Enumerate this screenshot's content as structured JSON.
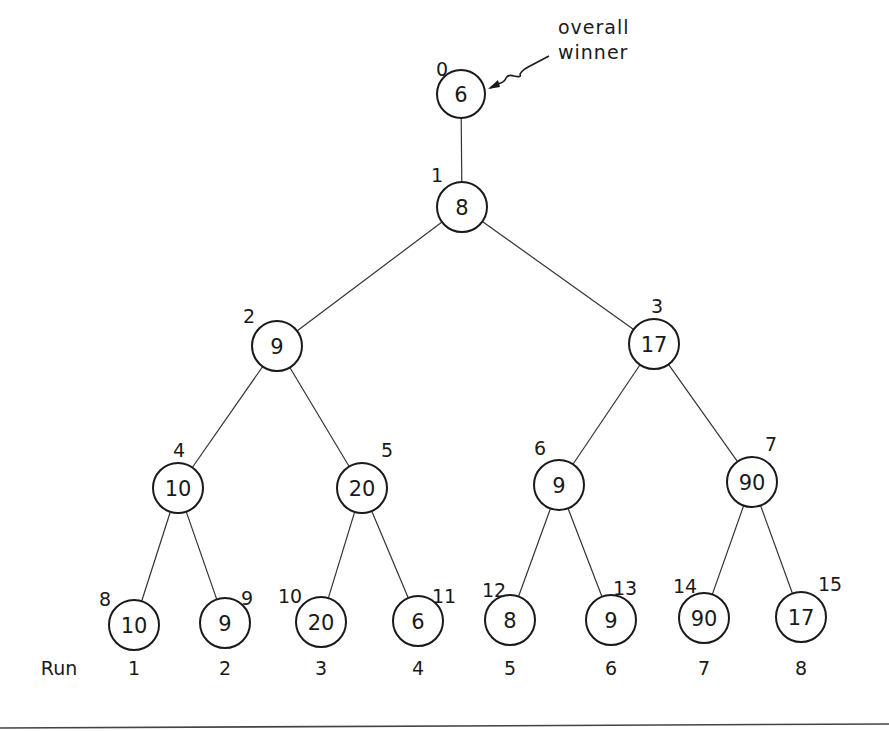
{
  "annotation": {
    "line1": "overall",
    "line2": "winner"
  },
  "run_label": "Run",
  "nodes": [
    {
      "index": "0",
      "value": "6",
      "cx": 461,
      "cy": 94,
      "r": 24,
      "lx": 442,
      "ly": 69
    },
    {
      "index": "1",
      "value": "8",
      "cx": 462,
      "cy": 207,
      "r": 25,
      "lx": 437,
      "ly": 175
    },
    {
      "index": "2",
      "value": "9",
      "cx": 277,
      "cy": 346,
      "r": 25,
      "lx": 249,
      "ly": 316
    },
    {
      "index": "3",
      "value": "17",
      "cx": 654,
      "cy": 344,
      "r": 25,
      "lx": 657,
      "ly": 306
    },
    {
      "index": "4",
      "value": "10",
      "cx": 178,
      "cy": 488,
      "r": 25,
      "lx": 179,
      "ly": 450
    },
    {
      "index": "5",
      "value": "20",
      "cx": 362,
      "cy": 488,
      "r": 25,
      "lx": 387,
      "ly": 450
    },
    {
      "index": "6",
      "value": "9",
      "cx": 559,
      "cy": 485,
      "r": 25,
      "lx": 540,
      "ly": 448
    },
    {
      "index": "7",
      "value": "90",
      "cx": 752,
      "cy": 482,
      "r": 25,
      "lx": 771,
      "ly": 444
    },
    {
      "index": "8",
      "value": "10",
      "cx": 134,
      "cy": 625,
      "r": 25,
      "lx": 105,
      "ly": 599
    },
    {
      "index": "9",
      "value": "9",
      "cx": 225,
      "cy": 623,
      "r": 25,
      "lx": 247,
      "ly": 598
    },
    {
      "index": "10",
      "value": "20",
      "cx": 321,
      "cy": 622,
      "r": 25,
      "lx": 290,
      "ly": 596
    },
    {
      "index": "11",
      "value": "6",
      "cx": 418,
      "cy": 621,
      "r": 25,
      "lx": 444,
      "ly": 596
    },
    {
      "index": "12",
      "value": "8",
      "cx": 510,
      "cy": 620,
      "r": 25,
      "lx": 494,
      "ly": 590
    },
    {
      "index": "13",
      "value": "9",
      "cx": 611,
      "cy": 620,
      "r": 25,
      "lx": 625,
      "ly": 588
    },
    {
      "index": "14",
      "value": "90",
      "cx": 704,
      "cy": 618,
      "r": 25,
      "lx": 685,
      "ly": 586
    },
    {
      "index": "15",
      "value": "17",
      "cx": 801,
      "cy": 617,
      "r": 25,
      "lx": 830,
      "ly": 584
    }
  ],
  "edges": [
    [
      0,
      1
    ],
    [
      1,
      2
    ],
    [
      1,
      3
    ],
    [
      2,
      4
    ],
    [
      2,
      5
    ],
    [
      3,
      6
    ],
    [
      3,
      7
    ],
    [
      4,
      8
    ],
    [
      4,
      9
    ],
    [
      5,
      10
    ],
    [
      5,
      11
    ],
    [
      6,
      12
    ],
    [
      6,
      13
    ],
    [
      7,
      14
    ],
    [
      7,
      15
    ]
  ],
  "runs": [
    {
      "label": "1",
      "x": 134
    },
    {
      "label": "2",
      "x": 225
    },
    {
      "label": "3",
      "x": 321
    },
    {
      "label": "4",
      "x": 418
    },
    {
      "label": "5",
      "x": 510
    },
    {
      "label": "6",
      "x": 611
    },
    {
      "label": "7",
      "x": 704
    },
    {
      "label": "8",
      "x": 801
    }
  ]
}
